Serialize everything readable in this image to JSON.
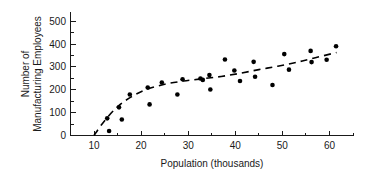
{
  "chart_data": {
    "type": "scatter",
    "title": "",
    "xlabel": "Population (thousands)",
    "ylabel": "Number of\nManufacturing Employees",
    "ylabel_line1": "Number of",
    "ylabel_line2": "Manufacturing Employees",
    "xlim": [
      5,
      65
    ],
    "ylim": [
      0,
      540
    ],
    "xticks": [
      10,
      20,
      30,
      40,
      50,
      60
    ],
    "xtick_labels": [
      "10",
      "20",
      "30",
      "40",
      "50",
      "60"
    ],
    "xminor_step": 5,
    "yticks": [
      0,
      100,
      200,
      300,
      400,
      500
    ],
    "ytick_labels": [
      "0",
      "100",
      "200",
      "300",
      "400",
      "500"
    ],
    "yminor_step": 50,
    "grid": false,
    "legend": null,
    "marker": "filled-circle",
    "marker_color": "#000000",
    "trend_line_style": "dashed",
    "trend_line_color": "#000000",
    "points": [
      {
        "x": 12.8,
        "y": 75
      },
      {
        "x": 13.2,
        "y": 20
      },
      {
        "x": 15.3,
        "y": 123
      },
      {
        "x": 15.9,
        "y": 70
      },
      {
        "x": 17.6,
        "y": 179
      },
      {
        "x": 21.4,
        "y": 210
      },
      {
        "x": 21.8,
        "y": 136
      },
      {
        "x": 24.4,
        "y": 232
      },
      {
        "x": 27.7,
        "y": 179
      },
      {
        "x": 28.8,
        "y": 246
      },
      {
        "x": 32.6,
        "y": 249
      },
      {
        "x": 33.1,
        "y": 243
      },
      {
        "x": 34.5,
        "y": 264
      },
      {
        "x": 34.7,
        "y": 201
      },
      {
        "x": 37.8,
        "y": 332
      },
      {
        "x": 39.8,
        "y": 284
      },
      {
        "x": 41.0,
        "y": 238
      },
      {
        "x": 43.9,
        "y": 322
      },
      {
        "x": 44.2,
        "y": 257
      },
      {
        "x": 47.9,
        "y": 221
      },
      {
        "x": 50.4,
        "y": 356
      },
      {
        "x": 51.4,
        "y": 288
      },
      {
        "x": 56.0,
        "y": 370
      },
      {
        "x": 56.2,
        "y": 321
      },
      {
        "x": 59.4,
        "y": 331
      },
      {
        "x": 61.4,
        "y": 390
      }
    ],
    "trend_points": [
      {
        "x": 10.0,
        "y": 0
      },
      {
        "x": 11.5,
        "y": 45
      },
      {
        "x": 13.5,
        "y": 95
      },
      {
        "x": 15.5,
        "y": 135
      },
      {
        "x": 18.0,
        "y": 170
      },
      {
        "x": 21.0,
        "y": 200
      },
      {
        "x": 25.0,
        "y": 224
      },
      {
        "x": 29.0,
        "y": 238
      },
      {
        "x": 33.0,
        "y": 248
      },
      {
        "x": 37.0,
        "y": 258
      },
      {
        "x": 41.0,
        "y": 272
      },
      {
        "x": 45.0,
        "y": 288
      },
      {
        "x": 49.0,
        "y": 303
      },
      {
        "x": 53.0,
        "y": 320
      },
      {
        "x": 57.0,
        "y": 340
      },
      {
        "x": 61.5,
        "y": 363
      }
    ]
  }
}
